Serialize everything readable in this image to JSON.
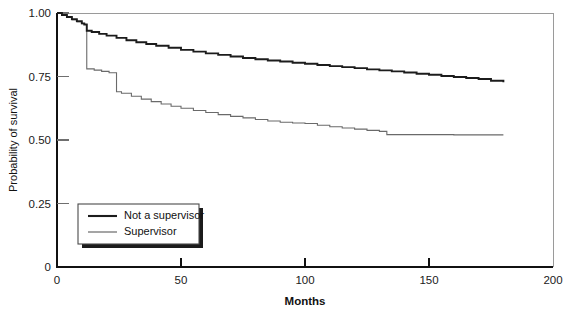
{
  "chart_data": {
    "type": "line",
    "title": "",
    "subtitle": "",
    "xlabel": "Months",
    "ylabel": "Probability of survival",
    "xlim": [
      0,
      200
    ],
    "ylim": [
      0,
      1.0
    ],
    "xticks": [
      0,
      50,
      100,
      150,
      200
    ],
    "xtick_labels": [
      "0",
      "50",
      "100",
      "150",
      "200"
    ],
    "yticks": [
      0,
      0.25,
      0.5,
      0.75,
      1.0
    ],
    "ytick_labels": [
      "0",
      "0.25",
      "0.50",
      "0.75",
      "1.00"
    ],
    "grid": false,
    "legend_position": "lower-left-inside",
    "curve_style": "kaplan-meier step function",
    "data_extent_months": 180,
    "series": [
      {
        "name": "Not a supervisor",
        "color": "#1c1c1c",
        "line_width": "thick",
        "final_value": 0.727,
        "x": [
          0,
          2,
          4,
          6,
          8,
          10,
          11,
          12,
          14,
          17,
          20,
          24,
          28,
          32,
          36,
          40,
          45,
          50,
          55,
          60,
          65,
          70,
          75,
          80,
          85,
          90,
          95,
          100,
          105,
          110,
          115,
          120,
          125,
          130,
          135,
          140,
          145,
          150,
          155,
          160,
          165,
          170,
          175,
          180
        ],
        "y": [
          1.0,
          0.992,
          0.984,
          0.976,
          0.968,
          0.959,
          0.955,
          0.93,
          0.925,
          0.918,
          0.911,
          0.902,
          0.893,
          0.885,
          0.878,
          0.871,
          0.863,
          0.855,
          0.848,
          0.841,
          0.835,
          0.829,
          0.823,
          0.818,
          0.813,
          0.809,
          0.804,
          0.8,
          0.795,
          0.791,
          0.787,
          0.783,
          0.778,
          0.774,
          0.77,
          0.766,
          0.761,
          0.757,
          0.752,
          0.748,
          0.744,
          0.74,
          0.733,
          0.727
        ]
      },
      {
        "name": "Supervisor",
        "color": "#6a6a6a",
        "line_width": "thin",
        "final_value": 0.52,
        "x": [
          0,
          2,
          4,
          6,
          8,
          10,
          11,
          12,
          15,
          18,
          21,
          24,
          26,
          30,
          34,
          38,
          42,
          46,
          50,
          55,
          60,
          65,
          70,
          75,
          80,
          85,
          90,
          95,
          100,
          105,
          110,
          115,
          120,
          125,
          130,
          133,
          140,
          150,
          160,
          170,
          180
        ],
        "y": [
          1.0,
          0.991,
          0.982,
          0.973,
          0.965,
          0.958,
          0.955,
          0.78,
          0.775,
          0.77,
          0.765,
          0.69,
          0.684,
          0.672,
          0.661,
          0.651,
          0.642,
          0.633,
          0.625,
          0.616,
          0.608,
          0.6,
          0.593,
          0.587,
          0.581,
          0.575,
          0.57,
          0.567,
          0.565,
          0.558,
          0.552,
          0.547,
          0.543,
          0.538,
          0.534,
          0.521,
          0.521,
          0.521,
          0.52,
          0.52,
          0.52
        ]
      }
    ],
    "annotations": [
      {
        "label": "first major drop",
        "x": 12,
        "series": "both"
      },
      {
        "label": "second major drop",
        "x": 24,
        "series": "Supervisor"
      }
    ]
  },
  "axes": {
    "x_title": "Months",
    "y_title": "Probability of survival",
    "x_tick_labels": [
      "0",
      "50",
      "100",
      "150",
      "200"
    ],
    "y_tick_labels": [
      "0",
      "0.25",
      "0.50",
      "0.75",
      "1.00"
    ]
  },
  "legend": {
    "items": [
      {
        "label": "Not a supervisor",
        "swatch": "thick-black-line"
      },
      {
        "label": "Supervisor",
        "swatch": "thin-gray-line"
      }
    ]
  }
}
